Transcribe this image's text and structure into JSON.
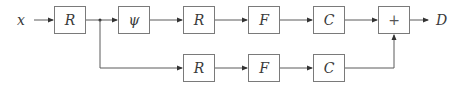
{
  "diagram": {
    "input_label": "x",
    "output_label": "D",
    "top_row": [
      {
        "id": "r1",
        "label": "R"
      },
      {
        "id": "psi",
        "label": "ψ"
      },
      {
        "id": "r2",
        "label": "R"
      },
      {
        "id": "f1",
        "label": "F"
      },
      {
        "id": "c1",
        "label": "C"
      },
      {
        "id": "sum",
        "label": "+"
      }
    ],
    "bottom_row": [
      {
        "id": "r3",
        "label": "R"
      },
      {
        "id": "f2",
        "label": "F"
      },
      {
        "id": "c2",
        "label": "C"
      }
    ],
    "colors": {
      "stroke": "#7a7a7a",
      "text": "#3a3a3a"
    }
  }
}
